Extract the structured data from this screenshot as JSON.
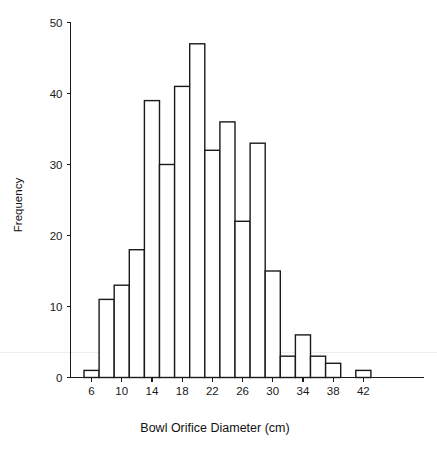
{
  "figure": {
    "background_color": "#ffffff",
    "ink_color": "#1a1a1a"
  },
  "chart_data": {
    "type": "bar",
    "title": "",
    "subtitle": "",
    "xlabel": "Bowl Orifice Diameter (cm)",
    "ylabel": "Frequency",
    "xlim": [
      4.5,
      44.5
    ],
    "ylim": [
      0,
      50
    ],
    "grid": false,
    "legend": null,
    "bin_width": 2,
    "xticks": [
      6,
      10,
      14,
      18,
      22,
      26,
      30,
      34,
      38,
      42
    ],
    "xtick_labels": [
      "6",
      "10",
      "14",
      "18",
      "22",
      "26",
      "30",
      "34",
      "38",
      "42"
    ],
    "yticks": [
      0,
      10,
      20,
      30,
      40,
      50
    ],
    "ytick_labels": [
      "0",
      "10",
      "20",
      "30",
      "40",
      "50"
    ],
    "categories": [
      6,
      8,
      10,
      12,
      14,
      16,
      18,
      20,
      22,
      24,
      26,
      28,
      30,
      32,
      34,
      36,
      38,
      40,
      42
    ],
    "values": [
      1,
      11,
      13,
      18,
      39,
      30,
      41,
      47,
      32,
      36,
      22,
      33,
      15,
      3,
      6,
      3,
      2,
      0,
      1
    ],
    "bars": [
      {
        "center": 6,
        "start": 5,
        "end": 7,
        "value": 1
      },
      {
        "center": 8,
        "start": 7,
        "end": 9,
        "value": 11
      },
      {
        "center": 10,
        "start": 9,
        "end": 11,
        "value": 13
      },
      {
        "center": 12,
        "start": 11,
        "end": 13,
        "value": 18
      },
      {
        "center": 14,
        "start": 13,
        "end": 15,
        "value": 39
      },
      {
        "center": 16,
        "start": 15,
        "end": 17,
        "value": 30
      },
      {
        "center": 18,
        "start": 17,
        "end": 19,
        "value": 41
      },
      {
        "center": 20,
        "start": 19,
        "end": 21,
        "value": 47
      },
      {
        "center": 22,
        "start": 21,
        "end": 23,
        "value": 32
      },
      {
        "center": 24,
        "start": 23,
        "end": 25,
        "value": 36
      },
      {
        "center": 26,
        "start": 25,
        "end": 27,
        "value": 22
      },
      {
        "center": 28,
        "start": 27,
        "end": 29,
        "value": 33
      },
      {
        "center": 30,
        "start": 29,
        "end": 31,
        "value": 15
      },
      {
        "center": 32,
        "start": 31,
        "end": 33,
        "value": 3
      },
      {
        "center": 34,
        "start": 33,
        "end": 35,
        "value": 6
      },
      {
        "center": 36,
        "start": 35,
        "end": 37,
        "value": 3
      },
      {
        "center": 38,
        "start": 37,
        "end": 39,
        "value": 2
      },
      {
        "center": 40,
        "start": 39,
        "end": 41,
        "value": 0
      },
      {
        "center": 42,
        "start": 41,
        "end": 43,
        "value": 1
      }
    ],
    "total_count": 353
  }
}
